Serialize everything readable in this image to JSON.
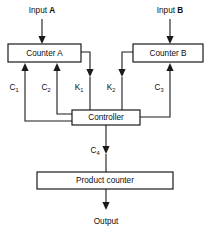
{
  "diagram": {
    "colors": {
      "stroke": "#1a1a1a",
      "fill": "#ffffff",
      "text": "#0d0d0d"
    },
    "blocks": [
      {
        "id": "counter_a",
        "label": "Counter A"
      },
      {
        "id": "counter_b",
        "label": "Counter B"
      },
      {
        "id": "controller",
        "label": "Controller"
      },
      {
        "id": "product_counter",
        "label": "Product counter"
      }
    ],
    "io": [
      {
        "id": "input_a",
        "text": "Input ",
        "emphasis": "A"
      },
      {
        "id": "input_b",
        "text": "Input ",
        "emphasis": "B"
      },
      {
        "id": "output",
        "text": "Output",
        "emphasis": ""
      }
    ],
    "signals": [
      {
        "id": "c1",
        "base": "C",
        "sub": "1",
        "direction": "controller-to-counter-a"
      },
      {
        "id": "c2",
        "base": "C",
        "sub": "2",
        "direction": "controller-to-counter-a"
      },
      {
        "id": "k1",
        "base": "K",
        "sub": "1",
        "direction": "counter-a-to-controller"
      },
      {
        "id": "k2",
        "base": "K",
        "sub": "2",
        "direction": "counter-b-to-controller"
      },
      {
        "id": "c3",
        "base": "C",
        "sub": "3",
        "direction": "controller-to-counter-b"
      },
      {
        "id": "c4",
        "base": "C",
        "sub": "4",
        "direction": "controller-to-product-counter"
      }
    ]
  }
}
